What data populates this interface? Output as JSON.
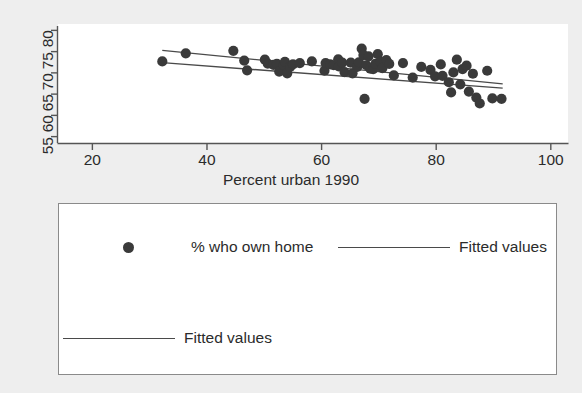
{
  "chart_data": {
    "type": "scatter",
    "title": "",
    "xlabel": "Percent urban 1990",
    "ylabel": "",
    "xlim": [
      14,
      103
    ],
    "ylim": [
      53.5,
      81.5
    ],
    "xticks": [
      20,
      40,
      60,
      80,
      100
    ],
    "yticks": [
      55,
      60,
      65,
      70,
      75,
      80
    ],
    "grid": false,
    "legend_position": "below-plot",
    "marker_color": "#3a3a3a",
    "line_color": "#4a4a4a",
    "background_color": "#eeeeee",
    "panel_color": "#ffffff",
    "series": [
      {
        "name": "% who own home",
        "type": "scatter",
        "points": [
          [
            32.2,
            72.7
          ],
          [
            36.3,
            74.6
          ],
          [
            44.6,
            75.2
          ],
          [
            46.5,
            72.9
          ],
          [
            47.0,
            70.6
          ],
          [
            50.1,
            73.1
          ],
          [
            50.6,
            72.2
          ],
          [
            51.6,
            71.9
          ],
          [
            52.2,
            72.1
          ],
          [
            52.6,
            70.3
          ],
          [
            53.4,
            71.8
          ],
          [
            53.6,
            72.6
          ],
          [
            54.0,
            69.9
          ],
          [
            54.5,
            71.4
          ],
          [
            55.0,
            72.0
          ],
          [
            56.2,
            72.3
          ],
          [
            58.3,
            72.7
          ],
          [
            60.5,
            70.5
          ],
          [
            60.7,
            72.3
          ],
          [
            61.5,
            72.0
          ],
          [
            62.1,
            71.8
          ],
          [
            62.9,
            73.2
          ],
          [
            63.0,
            71.5
          ],
          [
            63.6,
            72.4
          ],
          [
            64.0,
            70.2
          ],
          [
            65.1,
            72.4
          ],
          [
            65.4,
            69.9
          ],
          [
            66.2,
            71.4
          ],
          [
            66.5,
            72.5
          ],
          [
            67.0,
            75.7
          ],
          [
            67.3,
            74.2
          ],
          [
            67.5,
            63.9
          ],
          [
            67.8,
            71.8
          ],
          [
            68.2,
            73.9
          ],
          [
            68.5,
            71.0
          ],
          [
            69.0,
            70.9
          ],
          [
            69.4,
            72.1
          ],
          [
            69.8,
            74.4
          ],
          [
            70.3,
            72.6
          ],
          [
            70.6,
            71.1
          ],
          [
            71.3,
            73.0
          ],
          [
            71.8,
            72.1
          ],
          [
            72.6,
            69.4
          ],
          [
            74.2,
            72.3
          ],
          [
            75.9,
            68.9
          ],
          [
            77.4,
            71.4
          ],
          [
            79.0,
            70.7
          ],
          [
            79.8,
            69.2
          ],
          [
            80.8,
            72.0
          ],
          [
            81.1,
            69.3
          ],
          [
            82.2,
            67.8
          ],
          [
            82.6,
            65.4
          ],
          [
            83.0,
            70.1
          ],
          [
            83.6,
            73.1
          ],
          [
            84.2,
            67.3
          ],
          [
            84.6,
            70.9
          ],
          [
            85.3,
            71.7
          ],
          [
            85.7,
            65.6
          ],
          [
            86.4,
            69.8
          ],
          [
            87.0,
            64.2
          ],
          [
            87.6,
            62.8
          ],
          [
            88.9,
            70.5
          ],
          [
            89.8,
            64.0
          ],
          [
            91.4,
            63.9
          ]
        ]
      },
      {
        "name": "Fitted values",
        "type": "line",
        "points": [
          [
            32.2,
            75.3
          ],
          [
            91.6,
            67.4
          ]
        ]
      },
      {
        "name": "Fitted values",
        "type": "line",
        "points": [
          [
            32.2,
            72.4
          ],
          [
            91.6,
            66.4
          ]
        ]
      }
    ]
  },
  "axes": {
    "y_tick_labels": [
      "55",
      "60",
      "65",
      "70",
      "75",
      "80"
    ],
    "x_tick_labels": [
      "20",
      "40",
      "60",
      "80",
      "100"
    ],
    "x_axis_title": "Percent urban 1990"
  },
  "legend": {
    "entries": [
      {
        "label": "% who own home",
        "marker": "dot"
      },
      {
        "label": "Fitted values",
        "marker": "line"
      },
      {
        "label": "Fitted values",
        "marker": "line"
      }
    ]
  }
}
